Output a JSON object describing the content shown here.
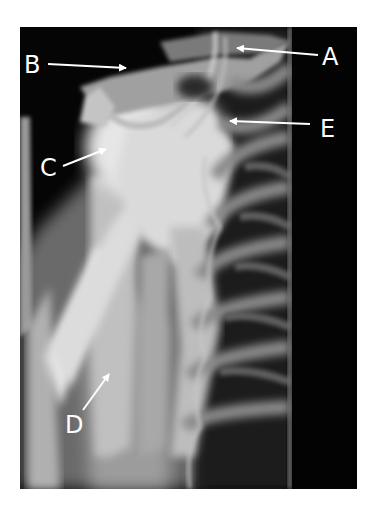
{
  "figure": {
    "type": "radiograph",
    "background": "#050505",
    "bone_color": "#d8d8d8",
    "label_color": "#ffffff"
  },
  "labels": [
    {
      "id": "A",
      "text": "A",
      "x": 322,
      "y": 45
    },
    {
      "id": "B",
      "text": "B",
      "x": 24,
      "y": 53
    },
    {
      "id": "C",
      "text": "C",
      "x": 40,
      "y": 156
    },
    {
      "id": "D",
      "text": "D",
      "x": 65,
      "y": 413
    },
    {
      "id": "E",
      "text": "E",
      "x": 320,
      "y": 117
    }
  ],
  "arrows": [
    {
      "id": "A",
      "x1": 318,
      "y1": 55,
      "x2": 237,
      "y2": 48
    },
    {
      "id": "B",
      "x1": 48,
      "y1": 64,
      "x2": 126,
      "y2": 68
    },
    {
      "id": "C",
      "x1": 63,
      "y1": 166,
      "x2": 106,
      "y2": 149
    },
    {
      "id": "D",
      "x1": 83,
      "y1": 410,
      "x2": 109,
      "y2": 374
    },
    {
      "id": "E",
      "x1": 310,
      "y1": 124,
      "x2": 230,
      "y2": 121
    }
  ]
}
